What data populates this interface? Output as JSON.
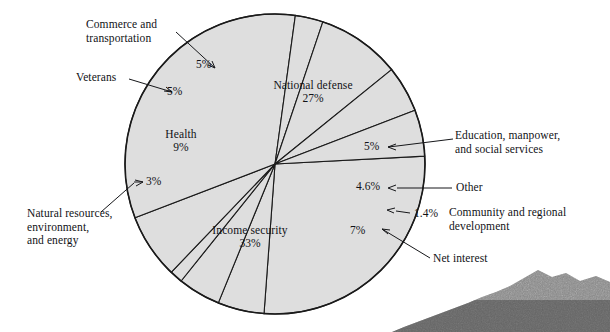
{
  "figure": {
    "title": "",
    "background_color": "#ffffff",
    "slice_fill_color": "#dedede",
    "slice_stroke_color": "#1a1a1a",
    "text_color": "#111216"
  },
  "chart_data": {
    "type": "pie",
    "title": "",
    "xlabel": "",
    "ylabel": "",
    "legend_position": "callout-labels",
    "grid": false,
    "units": "percent",
    "start_angle_deg": -3,
    "direction": "clockwise",
    "categories": [
      "National defense",
      "Education, manpower, and social services",
      "Other",
      "Community and regional development",
      "Net interest",
      "Income security",
      "Natural resources, environment, and energy",
      "Health",
      "Veterans",
      "Commerce and transportation"
    ],
    "values": [
      27,
      5,
      4.6,
      1.4,
      7,
      33,
      3,
      9,
      5,
      5
    ],
    "slices": [
      {
        "name": "National defense",
        "value": 27,
        "value_label": "27%",
        "label": "National defense",
        "label_placement": "inside",
        "label_x": 313,
        "label_y": 84,
        "pct_x": 313,
        "pct_y": 97
      },
      {
        "name": "Education, manpower, and social services",
        "value": 5,
        "value_label": "5%",
        "label": "Education, manpower,\nand social services",
        "label_placement": "outside-right",
        "label_x": 455,
        "label_y": 133,
        "pct_x": 372,
        "pct_y": 145
      },
      {
        "name": "Other",
        "value": 4.6,
        "value_label": "4.6%",
        "label": "Other",
        "label_placement": "outside-right",
        "label_x": 456,
        "label_y": 182,
        "pct_x": 366,
        "pct_y": 181
      },
      {
        "name": "Community and regional development",
        "value": 1.4,
        "value_label": "1.4%",
        "label": "Community and regional\ndevelopment",
        "label_placement": "outside-right",
        "label_x": 457,
        "label_y": 211,
        "pct_x": 414,
        "pct_y": 212
      },
      {
        "name": "Net interest",
        "value": 7,
        "value_label": "7%",
        "label": "Net interest",
        "label_placement": "outside-right",
        "label_x": 433,
        "label_y": 256,
        "pct_x": 356,
        "pct_y": 225
      },
      {
        "name": "Income security",
        "value": 33,
        "value_label": "33%",
        "label": "Income security",
        "label_placement": "inside",
        "label_x": 249,
        "label_y": 227,
        "pct_x": 249,
        "pct_y": 240
      },
      {
        "name": "Natural resources, environment, and energy",
        "value": 3,
        "value_label": "3%",
        "label": "Natural resources,\nenvironment,\nand energy",
        "label_placement": "outside-left",
        "label_x": 30,
        "label_y": 213,
        "pct_x": 152,
        "pct_y": 180
      },
      {
        "name": "Health",
        "value": 9,
        "value_label": "9%",
        "label": "Health",
        "label_placement": "inside",
        "label_x": 181,
        "label_y": 133,
        "pct_x": 181,
        "pct_y": 146
      },
      {
        "name": "Veterans",
        "value": 5,
        "value_label": "5%",
        "label": "Veterans",
        "label_placement": "outside-left",
        "label_x": 76,
        "label_y": 72,
        "pct_x": 175,
        "pct_y": 90
      },
      {
        "name": "Commerce and transportation",
        "value": 5,
        "value_label": "5%",
        "label": "Commerce and\ntransportation",
        "label_placement": "outside-left",
        "label_x": 86,
        "label_y": 21,
        "pct_x": 204,
        "pct_y": 63
      }
    ]
  },
  "geometry": {
    "center_x": 275,
    "center_y": 164,
    "radius": 150
  }
}
